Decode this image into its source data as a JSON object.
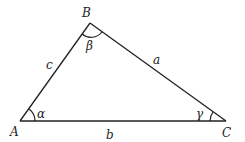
{
  "diagram": {
    "type": "triangle",
    "vertices": [
      {
        "id": "A",
        "label": "A",
        "x": 20,
        "y": 121
      },
      {
        "id": "B",
        "label": "B",
        "x": 90,
        "y": 23
      },
      {
        "id": "C",
        "label": "C",
        "x": 226,
        "y": 121
      }
    ],
    "sides": [
      {
        "label": "c",
        "from": "A",
        "to": "B"
      },
      {
        "label": "a",
        "from": "B",
        "to": "C"
      },
      {
        "label": "b",
        "from": "A",
        "to": "C"
      }
    ],
    "angles": [
      {
        "vertex": "A",
        "label": "α"
      },
      {
        "vertex": "B",
        "label": "β"
      },
      {
        "vertex": "C",
        "label": "γ"
      }
    ]
  }
}
